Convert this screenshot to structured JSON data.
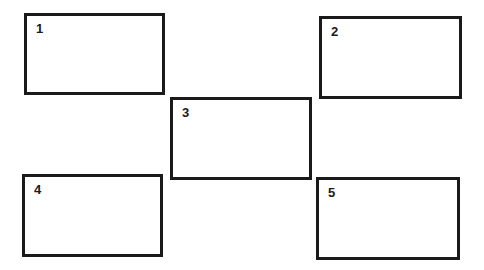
{
  "diagram": {
    "boxes": [
      {
        "label": "1",
        "x": 24,
        "y": 13,
        "w": 141,
        "h": 82
      },
      {
        "label": "2",
        "x": 319,
        "y": 16,
        "w": 143,
        "h": 83
      },
      {
        "label": "3",
        "x": 170,
        "y": 97,
        "w": 142,
        "h": 83
      },
      {
        "label": "4",
        "x": 22,
        "y": 174,
        "w": 141,
        "h": 83
      },
      {
        "label": "5",
        "x": 316,
        "y": 177,
        "w": 144,
        "h": 83
      }
    ]
  }
}
